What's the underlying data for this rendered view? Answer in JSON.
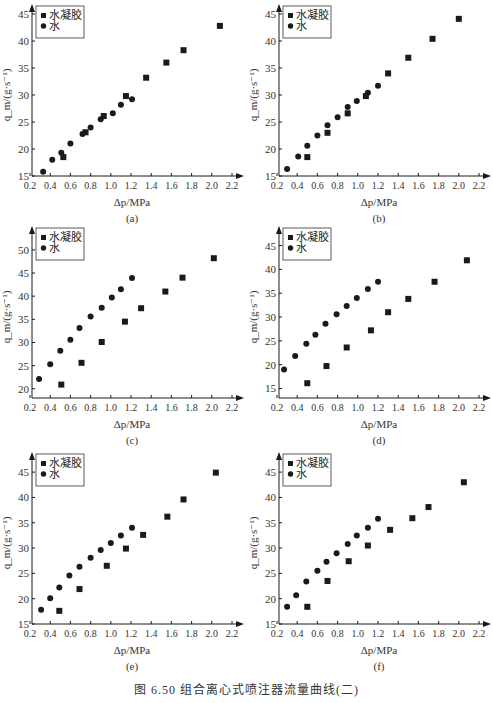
{
  "figure": {
    "caption": "图 6.50   组合离心式喷注器流量曲线(二)"
  },
  "legend": {
    "hydrogel": "水凝胶",
    "water": "水"
  },
  "axes": {
    "xlabel": "Δp/MPa",
    "ylabel": "q_m/(g·s⁻¹)"
  },
  "chart_data": [
    {
      "type": "scatter",
      "panel": "(a)",
      "xlabel": "Δp/MPa",
      "ylabel": "q_m/(g·s⁻¹)",
      "xlim": [
        0.2,
        2.2
      ],
      "ylim": [
        15,
        45
      ],
      "xticks": [
        0.2,
        0.4,
        0.6,
        0.8,
        1.0,
        1.2,
        1.4,
        1.6,
        1.8,
        2.0,
        2.2
      ],
      "yticks": [
        15,
        20,
        25,
        30,
        35,
        40,
        45
      ],
      "legend": [
        "水凝胶",
        "水"
      ],
      "series": [
        {
          "name": "水凝胶",
          "marker": "square",
          "x": [
            0.53,
            0.75,
            0.93,
            1.15,
            1.35,
            1.55,
            1.72,
            2.08
          ],
          "y": [
            18.5,
            23.1,
            26.1,
            29.8,
            33.2,
            36.0,
            38.3,
            42.8
          ]
        },
        {
          "name": "水",
          "marker": "circle",
          "x": [
            0.33,
            0.42,
            0.51,
            0.6,
            0.72,
            0.8,
            0.9,
            1.02,
            1.1,
            1.21
          ],
          "y": [
            15.8,
            18.0,
            19.3,
            21.0,
            22.8,
            24.0,
            25.5,
            26.6,
            28.2,
            29.2
          ]
        }
      ]
    },
    {
      "type": "scatter",
      "panel": "(b)",
      "xlabel": "Δp/MPa",
      "ylabel": "q_m/(g·s⁻¹)",
      "xlim": [
        0.2,
        2.2
      ],
      "ylim": [
        15,
        45
      ],
      "xticks": [
        0.2,
        0.4,
        0.6,
        0.8,
        1.0,
        1.2,
        1.4,
        1.6,
        1.8,
        2.0,
        2.2
      ],
      "yticks": [
        15,
        20,
        25,
        30,
        35,
        40,
        45
      ],
      "legend": [
        "水凝胶",
        "水"
      ],
      "series": [
        {
          "name": "水凝胶",
          "marker": "square",
          "x": [
            0.5,
            0.7,
            0.9,
            1.08,
            1.3,
            1.5,
            1.74,
            2.0
          ],
          "y": [
            18.5,
            23.0,
            26.6,
            29.8,
            34.0,
            36.9,
            40.4,
            44.1
          ]
        },
        {
          "name": "水",
          "marker": "circle",
          "x": [
            0.3,
            0.41,
            0.5,
            0.6,
            0.7,
            0.8,
            0.9,
            0.99,
            1.1,
            1.2
          ],
          "y": [
            16.3,
            18.6,
            20.6,
            22.5,
            24.4,
            25.9,
            27.8,
            28.9,
            30.4,
            31.7
          ]
        }
      ]
    },
    {
      "type": "scatter",
      "panel": "(c)",
      "xlabel": "Δp/MPa",
      "ylabel": "q_m/(g·s⁻¹)",
      "xlim": [
        0.2,
        2.2
      ],
      "ylim": [
        18,
        53
      ],
      "xticks": [
        0.2,
        0.4,
        0.6,
        0.8,
        1.0,
        1.2,
        1.4,
        1.6,
        1.8,
        2.0,
        2.2
      ],
      "yticks": [
        20,
        25,
        30,
        35,
        40,
        45,
        50
      ],
      "legend": [
        "水凝胶",
        "水"
      ],
      "series": [
        {
          "name": "水凝胶",
          "marker": "square",
          "x": [
            0.51,
            0.71,
            0.91,
            1.14,
            1.3,
            1.54,
            1.71,
            2.02
          ],
          "y": [
            20.9,
            25.6,
            30.1,
            34.5,
            37.4,
            41.0,
            44.0,
            48.2
          ]
        },
        {
          "name": "水",
          "marker": "circle",
          "x": [
            0.29,
            0.4,
            0.5,
            0.6,
            0.69,
            0.8,
            0.91,
            1.01,
            1.1,
            1.21
          ],
          "y": [
            22.1,
            25.3,
            28.2,
            30.6,
            33.1,
            35.6,
            37.5,
            39.7,
            41.5,
            43.9
          ]
        }
      ]
    },
    {
      "type": "scatter",
      "panel": "(d)",
      "xlabel": "Δp/MPa",
      "ylabel": "q_m/(g·s⁻¹)",
      "xlim": [
        0.2,
        2.2
      ],
      "ylim": [
        13,
        47
      ],
      "xticks": [
        0.2,
        0.4,
        0.6,
        0.8,
        1.0,
        1.2,
        1.4,
        1.6,
        1.8,
        2.0,
        2.2
      ],
      "yticks": [
        15,
        20,
        25,
        30,
        35,
        40,
        45
      ],
      "legend": [
        "水凝胶",
        "水"
      ],
      "series": [
        {
          "name": "水凝胶",
          "marker": "square",
          "x": [
            0.5,
            0.69,
            0.89,
            1.13,
            1.3,
            1.5,
            1.76,
            2.08
          ],
          "y": [
            16.1,
            19.7,
            23.6,
            27.2,
            31.0,
            33.8,
            37.4,
            41.9
          ]
        },
        {
          "name": "水",
          "marker": "circle",
          "x": [
            0.27,
            0.38,
            0.49,
            0.58,
            0.68,
            0.79,
            0.89,
            0.99,
            1.1,
            1.2
          ],
          "y": [
            19.0,
            21.8,
            24.4,
            26.3,
            28.6,
            30.6,
            32.3,
            34.0,
            35.9,
            37.4
          ]
        }
      ]
    },
    {
      "type": "scatter",
      "panel": "(e)",
      "xlabel": "Δp/MPa",
      "ylabel": "q_m/(g·s⁻¹)",
      "xlim": [
        0.2,
        2.2
      ],
      "ylim": [
        15,
        47
      ],
      "xticks": [
        0.2,
        0.4,
        0.6,
        0.8,
        1.0,
        1.2,
        1.4,
        1.6,
        1.8,
        2.0,
        2.2
      ],
      "yticks": [
        15,
        20,
        25,
        30,
        35,
        40,
        45
      ],
      "legend": [
        "水凝胶",
        "水"
      ],
      "series": [
        {
          "name": "水凝胶",
          "marker": "square",
          "x": [
            0.49,
            0.69,
            0.96,
            1.15,
            1.32,
            1.56,
            1.72,
            2.04
          ],
          "y": [
            17.6,
            21.9,
            26.5,
            29.9,
            32.6,
            36.2,
            39.6,
            44.9
          ]
        },
        {
          "name": "水",
          "marker": "circle",
          "x": [
            0.31,
            0.4,
            0.49,
            0.59,
            0.69,
            0.8,
            0.9,
            1.0,
            1.1,
            1.21
          ],
          "y": [
            17.8,
            20.1,
            22.2,
            24.6,
            26.3,
            28.1,
            29.6,
            31.0,
            32.5,
            34.0
          ]
        }
      ]
    },
    {
      "type": "scatter",
      "panel": "(f)",
      "xlabel": "Δp/MPa",
      "ylabel": "q_m/(g·s⁻¹)",
      "xlim": [
        0.2,
        2.2
      ],
      "ylim": [
        15,
        47
      ],
      "xticks": [
        0.2,
        0.4,
        0.6,
        0.8,
        1.0,
        1.2,
        1.4,
        1.6,
        1.8,
        2.0,
        2.2
      ],
      "yticks": [
        15,
        20,
        25,
        30,
        35,
        40,
        45
      ],
      "legend": [
        "水凝胶",
        "水"
      ],
      "series": [
        {
          "name": "水凝胶",
          "marker": "square",
          "x": [
            0.5,
            0.7,
            0.91,
            1.1,
            1.32,
            1.54,
            1.7,
            2.05
          ],
          "y": [
            18.4,
            23.5,
            27.4,
            30.5,
            33.6,
            35.9,
            38.1,
            43.0
          ]
        },
        {
          "name": "水",
          "marker": "circle",
          "x": [
            0.3,
            0.39,
            0.49,
            0.6,
            0.69,
            0.79,
            0.9,
            0.99,
            1.1,
            1.2
          ],
          "y": [
            18.4,
            20.7,
            23.4,
            25.5,
            27.3,
            29.0,
            30.8,
            32.5,
            34.0,
            35.8
          ]
        }
      ]
    }
  ]
}
